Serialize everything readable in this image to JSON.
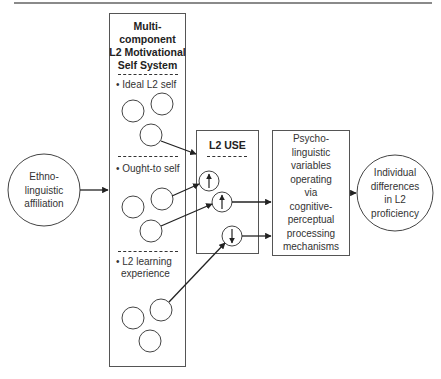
{
  "diagram": {
    "left_node": {
      "label_lines": [
        "Ethno-",
        "linguistic",
        "affiliation"
      ]
    },
    "motivational_system": {
      "title_lines": [
        "Multi-",
        "component",
        "L2 Motivational",
        "Self System"
      ],
      "components": [
        {
          "label": "• Ideal L2 self"
        },
        {
          "label": "• Ought-to self"
        },
        {
          "label_lines": [
            "• L2 learning",
            "experience"
          ]
        }
      ]
    },
    "l2_use": {
      "title": "L2 USE",
      "indicators": [
        {
          "direction": "up",
          "glyph": "↑"
        },
        {
          "direction": "up",
          "glyph": "↑"
        },
        {
          "direction": "down",
          "glyph": "↓"
        }
      ]
    },
    "psycholinguistic": {
      "label_lines": [
        "Psycho-",
        "linguistic",
        "variables",
        "operating",
        "via",
        "cognitive-",
        "perceptual",
        "processing",
        "mechanisms"
      ]
    },
    "right_node": {
      "label_lines": [
        "Individual",
        "differences",
        "in L2",
        "proficiency"
      ]
    },
    "colors": {
      "line": "#333333",
      "border": "#555555",
      "background": "#ffffff"
    }
  }
}
